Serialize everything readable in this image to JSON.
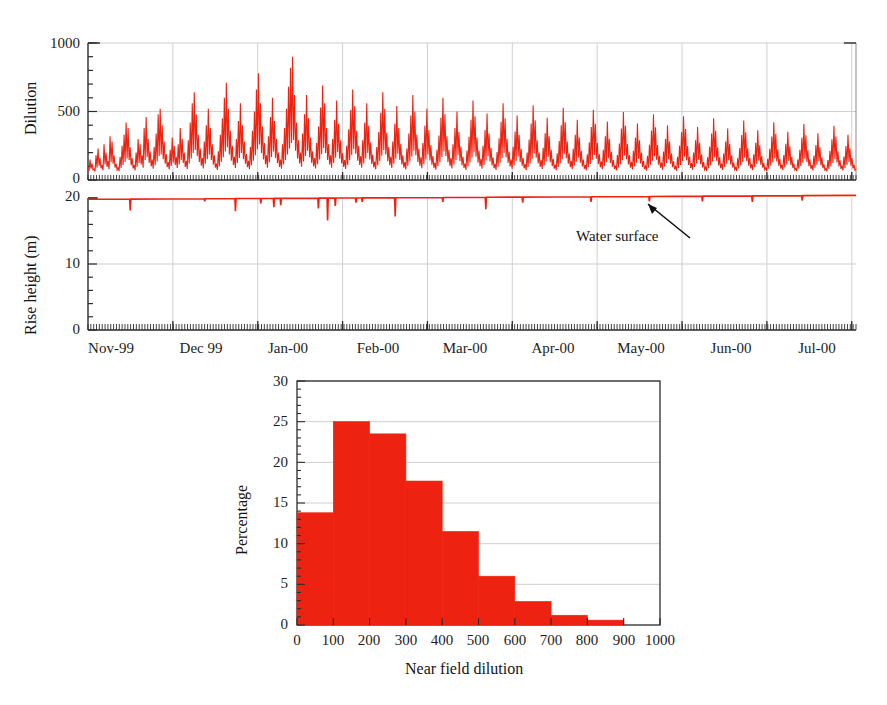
{
  "figure": {
    "top_partial_caption": "",
    "accent_color": "#ee2211",
    "axis_color": "#2b2b2b",
    "grid_color": "#cfcfd6"
  },
  "chart_data": [
    {
      "id": "dilution-timeseries",
      "type": "line",
      "title": "",
      "xlabel": "",
      "ylabel": "Dilution",
      "ylim": [
        0,
        1000
      ],
      "yticks": [
        0,
        500,
        1000
      ],
      "yticklabels": [
        "0",
        "500",
        "1000"
      ],
      "y_minor_interval": 100,
      "xticklabels": [
        "Nov-99",
        "Dec 99",
        "Jan-00",
        "Feb-00",
        "Mar-00",
        "Apr-00",
        "May-00",
        "Jun-00",
        "Jul-00"
      ],
      "x_minor_ticks": "daily",
      "grid": "major-xy",
      "series_color": "#ee2211",
      "series_name": "Near field dilution",
      "description": "Dense daily time series, highly variable, baseline near 50-100, typical range 100-600, peaks to about 900.",
      "values": [
        90,
        150,
        120,
        80,
        180,
        230,
        160,
        110,
        260,
        200,
        140,
        320,
        280,
        180,
        120,
        90,
        170,
        250,
        330,
        420,
        380,
        240,
        160,
        110,
        200,
        300,
        260,
        180,
        380,
        460,
        300,
        210,
        150,
        240,
        340,
        480,
        520,
        400,
        280,
        190,
        130,
        220,
        310,
        250,
        170,
        260,
        380,
        300,
        200,
        140,
        290,
        420,
        560,
        640,
        480,
        330,
        230,
        160,
        280,
        400,
        520,
        380,
        260,
        180,
        120,
        210,
        330,
        450,
        600,
        710,
        520,
        360,
        250,
        170,
        300,
        430,
        560,
        400,
        280,
        190,
        140,
        240,
        360,
        500,
        660,
        780,
        560,
        390,
        270,
        180,
        320,
        460,
        600,
        430,
        300,
        200,
        150,
        260,
        380,
        520,
        680,
        820,
        900,
        620,
        420,
        290,
        200,
        340,
        480,
        620,
        450,
        310,
        210,
        160,
        270,
        390,
        530,
        690,
        560,
        380,
        260,
        180,
        300,
        440,
        580,
        410,
        290,
        195,
        145,
        250,
        370,
        510,
        660,
        540,
        360,
        250,
        175,
        290,
        420,
        560,
        395,
        275,
        185,
        135,
        240,
        350,
        490,
        640,
        520,
        345,
        240,
        170,
        280,
        410,
        540,
        380,
        265,
        180,
        130,
        230,
        340,
        470,
        620,
        500,
        330,
        230,
        165,
        270,
        395,
        520,
        365,
        255,
        175,
        125,
        220,
        325,
        455,
        600,
        480,
        320,
        220,
        160,
        260,
        380,
        500,
        350,
        245,
        170,
        120,
        215,
        315,
        440,
        580,
        465,
        310,
        215,
        155,
        250,
        365,
        485,
        340,
        235,
        165,
        118,
        205,
        305,
        425,
        560,
        450,
        300,
        208,
        150,
        242,
        353,
        470,
        330,
        228,
        160,
        115,
        200,
        295,
        412,
        545,
        436,
        290,
        200,
        145,
        235,
        342,
        455,
        320,
        220,
        155,
        112,
        195,
        285,
        400,
        528,
        422,
        280,
        194,
        140,
        228,
        330,
        440,
        310,
        213,
        150,
        108,
        188,
        276,
        387,
        512,
        410,
        272,
        188,
        136,
        220,
        320,
        426,
        300,
        206,
        145,
        105,
        182,
        267,
        375,
        496,
        396,
        263,
        182,
        132,
        214,
        310,
        413,
        290,
        200,
        140,
        102,
        176,
        258,
        362,
        480,
        384,
        255,
        176,
        128,
        207,
        300,
        400,
        280,
        193,
        136,
        98,
        170,
        250,
        350,
        465,
        372,
        247,
        170,
        124,
        200,
        290,
        387,
        271,
        187,
        131,
        95,
        165,
        242,
        339,
        450,
        360,
        239,
        165,
        120,
        194,
        281,
        375,
        262,
        181,
        127,
        92,
        159,
        234,
        328,
        435,
        348,
        231,
        160,
        116,
        188,
        272,
        363,
        254,
        175,
        123,
        89,
        154,
        227,
        318,
        422,
        337,
        224,
        155,
        112,
        182,
        264,
        352,
        246,
        170,
        119,
        86,
        149,
        220,
        308,
        409,
        327,
        217,
        150,
        109,
        176,
        256,
        341,
        239,
        165,
        115,
        83,
        145,
        213,
        298,
        396,
        317,
        210,
        146,
        105,
        171,
        248,
        330,
        231,
        160,
        112,
        81
      ]
    },
    {
      "id": "rise-height-timeseries",
      "type": "line",
      "title": "",
      "xlabel": "",
      "ylabel": "Rise height (m)",
      "ylim": [
        0,
        20
      ],
      "yticks": [
        0,
        10,
        20
      ],
      "yticklabels": [
        "0",
        "10",
        "20"
      ],
      "y_minor_interval": 2,
      "xticklabels": [
        "Nov-99",
        "Dec 99",
        "Jan-00",
        "Feb-00",
        "Mar-00",
        "Apr-00",
        "May-00",
        "Jun-00",
        "Jul-00"
      ],
      "x_minor_ticks": "daily",
      "grid": "major-xy",
      "series_color": "#ee2211",
      "series_name": "Rise height",
      "annotation": "Water surface",
      "description": "Rise height pinned at the water surface (about 19.8 m rising slowly to 20.4 m) with occasional downward spikes to 16-19 m.",
      "baseline_start": 19.8,
      "baseline_end": 20.4,
      "spikes": [
        {
          "x_frac": 0.055,
          "value": 18.1
        },
        {
          "x_frac": 0.152,
          "value": 19.5
        },
        {
          "x_frac": 0.192,
          "value": 18.0
        },
        {
          "x_frac": 0.225,
          "value": 19.2
        },
        {
          "x_frac": 0.242,
          "value": 18.6
        },
        {
          "x_frac": 0.251,
          "value": 18.9
        },
        {
          "x_frac": 0.3,
          "value": 18.4
        },
        {
          "x_frac": 0.312,
          "value": 16.6
        },
        {
          "x_frac": 0.322,
          "value": 18.8
        },
        {
          "x_frac": 0.349,
          "value": 19.3
        },
        {
          "x_frac": 0.357,
          "value": 19.4
        },
        {
          "x_frac": 0.4,
          "value": 17.2
        },
        {
          "x_frac": 0.462,
          "value": 19.4
        },
        {
          "x_frac": 0.518,
          "value": 18.3
        },
        {
          "x_frac": 0.566,
          "value": 19.3
        },
        {
          "x_frac": 0.655,
          "value": 19.4
        },
        {
          "x_frac": 0.731,
          "value": 19.5
        },
        {
          "x_frac": 0.8,
          "value": 19.5
        },
        {
          "x_frac": 0.865,
          "value": 19.4
        },
        {
          "x_frac": 0.93,
          "value": 19.6
        }
      ]
    },
    {
      "id": "dilution-histogram",
      "type": "bar",
      "title": "",
      "xlabel": "Near field dilution",
      "ylabel": "Percentage",
      "ylim": [
        0,
        30
      ],
      "yticks": [
        0,
        5,
        10,
        15,
        20,
        25,
        30
      ],
      "yticklabels": [
        "0",
        "5",
        "10",
        "15",
        "20",
        "25",
        "30"
      ],
      "y_minor_interval": 1,
      "xlim": [
        0,
        1000
      ],
      "xticks": [
        0,
        100,
        200,
        300,
        400,
        500,
        600,
        700,
        800,
        900,
        1000
      ],
      "xticklabels": [
        "0",
        "100",
        "200",
        "300",
        "400",
        "500",
        "600",
        "700",
        "800",
        "900",
        "1000"
      ],
      "grid": "y",
      "bar_color": "#ee2211",
      "bin_edges": [
        0,
        100,
        200,
        300,
        400,
        500,
        600,
        700,
        800,
        900,
        1000
      ],
      "categories": [
        "0-100",
        "100-200",
        "200-300",
        "300-400",
        "400-500",
        "500-600",
        "600-700",
        "700-800",
        "800-900",
        "900-1000"
      ],
      "values": [
        13.8,
        25.0,
        23.5,
        17.7,
        11.5,
        6.0,
        2.9,
        1.2,
        0.6,
        0.0
      ]
    }
  ]
}
